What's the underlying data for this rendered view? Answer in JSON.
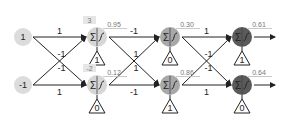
{
  "diagram": {
    "type": "neural-network",
    "colors": {
      "line": "#222222",
      "input_fill": "#dcdcdc",
      "layer1_fill": "#d6d6d6",
      "layer2_fill": "#a8a8a8",
      "layer3_fill": "#5a5a5a",
      "box_fill": "#e6e6e6",
      "label_text": "#222222",
      "value_text": "#777777"
    },
    "inputs": [
      {
        "id": "in0",
        "x": 23,
        "y": 37,
        "label": "1"
      },
      {
        "id": "in1",
        "x": 23,
        "y": 85,
        "label": "-1"
      }
    ],
    "neurons": [
      {
        "id": "n1a",
        "layer": 1,
        "x": 97,
        "y": 37,
        "sum_box": "3",
        "output": "0.95",
        "bias": "1"
      },
      {
        "id": "n1b",
        "layer": 1,
        "x": 97,
        "y": 85,
        "sum_box": "-2",
        "output": "0.12",
        "bias": "0"
      },
      {
        "id": "n2a",
        "layer": 2,
        "x": 170,
        "y": 37,
        "output": "0.30",
        "bias": "0"
      },
      {
        "id": "n2b",
        "layer": 2,
        "x": 170,
        "y": 85,
        "output": "0.86",
        "bias": "1"
      },
      {
        "id": "n3a",
        "layer": 3,
        "x": 242,
        "y": 37,
        "output": "0.61",
        "bias": "1",
        "has_output_arrow": true
      },
      {
        "id": "n3b",
        "layer": 3,
        "x": 242,
        "y": 85,
        "output": "0.64",
        "bias": "0",
        "has_output_arrow": true
      }
    ],
    "connections": [
      {
        "from": "in0",
        "to": "n1a",
        "weight": "1"
      },
      {
        "from": "in0",
        "to": "n1b",
        "weight": "-1"
      },
      {
        "from": "in1",
        "to": "n1a",
        "weight": "-1"
      },
      {
        "from": "in1",
        "to": "n1b",
        "weight": "1"
      },
      {
        "from": "n1a",
        "to": "n2a",
        "weight": "-1"
      },
      {
        "from": "n1a",
        "to": "n2b",
        "weight": "1"
      },
      {
        "from": "n1b",
        "to": "n2a",
        "weight": "1"
      },
      {
        "from": "n1b",
        "to": "n2b",
        "weight": "-1"
      },
      {
        "from": "n2a",
        "to": "n3a",
        "weight": "1"
      },
      {
        "from": "n2a",
        "to": "n3b",
        "weight": "-1"
      },
      {
        "from": "n2b",
        "to": "n3a",
        "weight": "-1"
      },
      {
        "from": "n2b",
        "to": "n3b",
        "weight": "1"
      }
    ],
    "symbols": {
      "sum": "Σ"
    }
  }
}
